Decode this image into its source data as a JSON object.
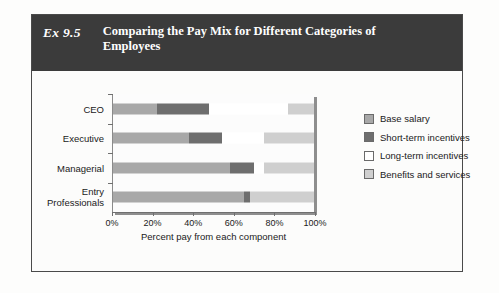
{
  "exhibit": {
    "tag": "Ex 9.5",
    "title": "Comparing the Pay Mix for Different Categories of Employees"
  },
  "chart_data": {
    "type": "bar",
    "orientation": "horizontal",
    "stacked": true,
    "title": "Comparing the Pay Mix for Different Categories of Employees",
    "xlabel": "Percent pay from each component",
    "ylabel": "",
    "xlim": [
      0,
      100
    ],
    "xticks": [
      0,
      20,
      40,
      60,
      80,
      100
    ],
    "xticklabels": [
      "0%",
      "20%",
      "40%",
      "60%",
      "80%",
      "100%"
    ],
    "grid": false,
    "legend_position": "right",
    "categories": [
      "CEO",
      "Executive",
      "Managerial",
      "Entry\nProfessionals"
    ],
    "series": [
      {
        "name": "Base salary",
        "color": "#a8a8a8",
        "values": [
          22,
          38,
          58,
          65
        ]
      },
      {
        "name": "Short-term incentives",
        "color": "#6e6e6e",
        "values": [
          26,
          16,
          12,
          3
        ]
      },
      {
        "name": "Long-term incentives",
        "color": "#ffffff",
        "values": [
          39,
          21,
          5,
          0
        ]
      },
      {
        "name": "Benefits and services",
        "color": "#cfcfcf",
        "values": [
          13,
          25,
          25,
          32
        ]
      }
    ]
  },
  "legend": {
    "items": [
      {
        "label": "Base salary"
      },
      {
        "label": "Short-term incentives"
      },
      {
        "label": "Long-term incentives"
      },
      {
        "label": "Benefits and services"
      }
    ]
  }
}
